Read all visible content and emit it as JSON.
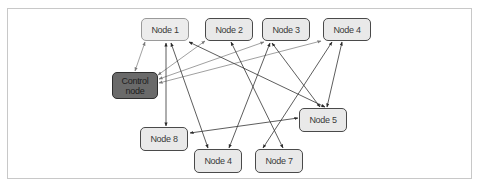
{
  "diagram": {
    "type": "network",
    "nodes": [
      {
        "id": "node1",
        "label": "Node 1",
        "x": 141,
        "y": 18,
        "w": 48,
        "h": 23,
        "style": "light"
      },
      {
        "id": "node2",
        "label": "Node 2",
        "x": 205,
        "y": 18,
        "w": 48,
        "h": 23,
        "style": "normal"
      },
      {
        "id": "node3",
        "label": "Node 3",
        "x": 262,
        "y": 18,
        "w": 48,
        "h": 23,
        "style": "normal"
      },
      {
        "id": "node4top",
        "label": "Node 4",
        "x": 323,
        "y": 18,
        "w": 48,
        "h": 23,
        "style": "normal"
      },
      {
        "id": "control",
        "label": "Control\nnode",
        "x": 112,
        "y": 72,
        "w": 46,
        "h": 27,
        "style": "control"
      },
      {
        "id": "node5",
        "label": "Node 5",
        "x": 299,
        "y": 108,
        "w": 48,
        "h": 24,
        "style": "normal"
      },
      {
        "id": "node8",
        "label": "Node 8",
        "x": 140,
        "y": 127,
        "w": 48,
        "h": 24,
        "style": "normal"
      },
      {
        "id": "node4bottom",
        "label": "Node 4",
        "x": 194,
        "y": 149,
        "w": 48,
        "h": 24,
        "style": "normal"
      },
      {
        "id": "node7",
        "label": "Node 7",
        "x": 255,
        "y": 149,
        "w": 48,
        "h": 24,
        "style": "normal"
      }
    ],
    "edges": [
      {
        "from": "control",
        "to": "node1",
        "bidirectional": true,
        "color": "#888888"
      },
      {
        "from": "control",
        "to": "node2",
        "bidirectional": true,
        "color": "#888888"
      },
      {
        "from": "control",
        "to": "node3",
        "bidirectional": true,
        "color": "#888888"
      },
      {
        "from": "control",
        "to": "node4top",
        "bidirectional": true,
        "color": "#888888"
      },
      {
        "from": "node1",
        "to": "node8",
        "bidirectional": true,
        "color": "#333333"
      },
      {
        "from": "node1",
        "to": "node4bottom",
        "bidirectional": true,
        "color": "#333333"
      },
      {
        "from": "node1",
        "to": "node5",
        "bidirectional": true,
        "color": "#333333"
      },
      {
        "from": "node2",
        "to": "node7",
        "bidirectional": true,
        "color": "#333333"
      },
      {
        "from": "node3",
        "to": "node4bottom",
        "bidirectional": true,
        "color": "#333333"
      },
      {
        "from": "node3",
        "to": "node5",
        "bidirectional": true,
        "color": "#333333"
      },
      {
        "from": "node4top",
        "to": "node7",
        "bidirectional": true,
        "color": "#333333"
      },
      {
        "from": "node4top",
        "to": "node5",
        "bidirectional": true,
        "color": "#333333"
      },
      {
        "from": "node8",
        "to": "node5",
        "bidirectional": true,
        "color": "#333333"
      }
    ]
  },
  "labels": {
    "node1": "Node 1",
    "node2": "Node 2",
    "node3": "Node 3",
    "node4top": "Node 4",
    "control": "Control\nnode",
    "node5": "Node 5",
    "node8": "Node 8",
    "node4bottom": "Node 4",
    "node7": "Node 7"
  },
  "colors": {
    "node_fill": "#e9e9e9",
    "node_border": "#4a4a4a",
    "control_fill": "#6a6a6a",
    "frame_border": "#c8c8c8",
    "edge_dark": "#333333",
    "edge_light": "#888888"
  }
}
